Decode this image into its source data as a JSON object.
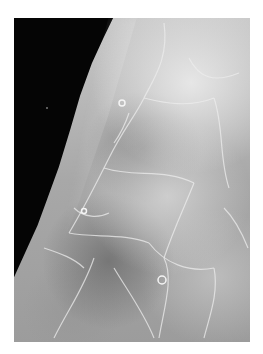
{
  "image": {
    "description": "Grayscale mammogram-style radiograph of breast tissue with white border",
    "colors": {
      "background": "#ffffff",
      "dark_region": "#050505",
      "tissue_light": "#d8d8d8",
      "tissue_mid": "#9a9a9a",
      "vessel_lines": "#e6e6e6"
    }
  }
}
